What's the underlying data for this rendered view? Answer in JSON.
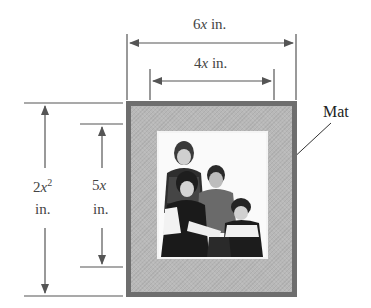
{
  "diagram": {
    "dimensions": {
      "outer_width": {
        "coef": "6",
        "var": "x",
        "unit": "in."
      },
      "inner_width": {
        "coef": "4",
        "var": "x",
        "unit": "in."
      },
      "outer_height": {
        "coef": "2",
        "var": "x",
        "exp": "2",
        "unit": "in."
      },
      "inner_height": {
        "coef": "5",
        "var": "x",
        "unit": "in."
      }
    },
    "callout": "Mat",
    "photo_description": "Family photo of four people"
  },
  "colors": {
    "frame_border": "#6e6e6e",
    "mat": "#b8b8b8",
    "lines": "#555555",
    "photo_border": "#f4f4f4"
  }
}
